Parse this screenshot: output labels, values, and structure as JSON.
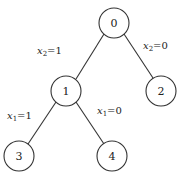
{
  "diagram": {
    "type": "binary-decision-tree",
    "nodes": [
      {
        "id": "0",
        "label": "0",
        "cx": 114,
        "cy": 23
      },
      {
        "id": "1",
        "label": "1",
        "cx": 66,
        "cy": 91
      },
      {
        "id": "2",
        "label": "2",
        "cx": 161,
        "cy": 91
      },
      {
        "id": "3",
        "label": "3",
        "cx": 19,
        "cy": 156
      },
      {
        "id": "4",
        "label": "4",
        "cx": 112,
        "cy": 156
      }
    ],
    "edges": [
      {
        "from": "0",
        "to": "1",
        "var": "x",
        "sub": "2",
        "value": "1"
      },
      {
        "from": "0",
        "to": "2",
        "var": "x",
        "sub": "2",
        "value": "0"
      },
      {
        "from": "1",
        "to": "3",
        "var": "x",
        "sub": "1",
        "value": "1"
      },
      {
        "from": "1",
        "to": "4",
        "var": "x",
        "sub": "1",
        "value": "0"
      }
    ],
    "edge_labels": {
      "e01": {
        "var": "x",
        "sub": "2",
        "eq": "=1"
      },
      "e02": {
        "var": "x",
        "sub": "2",
        "eq": "=0"
      },
      "e13": {
        "var": "x",
        "sub": "1",
        "eq": "=1"
      },
      "e14": {
        "var": "x",
        "sub": "1",
        "eq": "=0"
      }
    },
    "node_labels": {
      "n0": "0",
      "n1": "1",
      "n2": "2",
      "n3": "3",
      "n4": "4"
    }
  }
}
